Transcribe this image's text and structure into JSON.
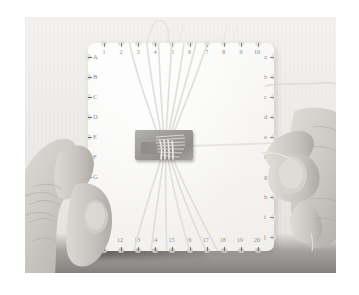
{
  "scene": {
    "title": "Hands holding a square braiding disk with threads",
    "subject": "kumihimo-braiding-board",
    "background_color": "#efeeeb",
    "board_color": "#f8f7f5",
    "weight_color": "#9d9c99",
    "thread_color": "#e3e1dd",
    "skin_color": "#d9d6d2",
    "label_color": "#8d8b87",
    "photo_border_color": "#ffffff"
  },
  "board": {
    "name": "braiding-disk",
    "top_labels": [
      "1",
      "2",
      "3",
      "4",
      "5",
      "6",
      "7",
      "8",
      "9",
      "10"
    ],
    "bottom_labels": [
      "11",
      "12",
      "13",
      "14",
      "15",
      "16",
      "17",
      "18",
      "19",
      "20"
    ],
    "left_labels": [
      "A",
      "B",
      "C",
      "D",
      "E",
      "F",
      "G",
      "H"
    ],
    "right_labels": [
      "a",
      "b",
      "c",
      "d",
      "e",
      "f",
      "g",
      "h",
      "i",
      "j"
    ],
    "notch_count_horizontal": 10,
    "notch_count_vertical": 10
  },
  "center": {
    "weight_label": "",
    "description": "gray rectangular clip holding the braid"
  },
  "hands": {
    "left_label": "",
    "right_label": ""
  }
}
